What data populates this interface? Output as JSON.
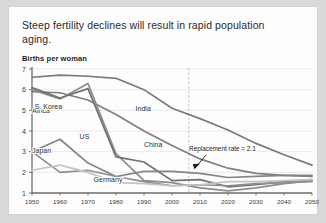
{
  "card": {
    "title": "Steep fertility declines will result in rapid population aging.",
    "y_axis_title": "Births per woman"
  },
  "colors": {
    "background": "#fdfdfd",
    "outer": "#d9d9d9",
    "border": "#d2d2d2",
    "axis": "#6f6f6f",
    "grid": "#e4e4e4",
    "dark_line": "#6e6e6e",
    "mid_line": "#8a8a8a",
    "light_line": "#c2c2c2",
    "text": "#2b2b2b",
    "annotation": "#1c1c1c"
  },
  "chart_data": {
    "type": "line",
    "title": "Steep fertility declines will result in rapid population aging.",
    "ylabel": "Births per woman",
    "xlabel": "",
    "ylim": [
      1,
      7
    ],
    "xlim": [
      1950,
      2050
    ],
    "grid": true,
    "legend_position": "inline-labels",
    "y_ticks": [
      1,
      2,
      3,
      4,
      5,
      6,
      7
    ],
    "x_ticks": [
      1950,
      1960,
      1970,
      1980,
      1990,
      2000,
      2010,
      2020,
      2030,
      2040,
      2050
    ],
    "x": [
      1950,
      1960,
      1970,
      1980,
      1990,
      2000,
      2010,
      2020,
      2030,
      2040,
      2050
    ],
    "series": [
      {
        "name": "Africa",
        "label": "Africa",
        "color": "#7a7a7a",
        "label_x": 1950,
        "label_y": 4.85,
        "values": [
          6.6,
          6.7,
          6.65,
          6.55,
          6.0,
          5.1,
          4.6,
          4.05,
          3.4,
          2.85,
          2.35
        ]
      },
      {
        "name": "India",
        "label": "India",
        "color": "#7f7f7f",
        "label_x": 1987,
        "label_y": 4.95,
        "values": [
          5.9,
          5.85,
          5.5,
          4.8,
          4.0,
          3.3,
          2.65,
          2.2,
          1.95,
          1.85,
          1.8
        ]
      },
      {
        "name": "S. Korea",
        "label": "S. Korea",
        "color": "#8d8d8d",
        "label_x": 1951,
        "label_y": 5.05,
        "values": [
          6.0,
          5.55,
          6.3,
          2.9,
          1.6,
          1.5,
          1.25,
          1.1,
          1.25,
          1.45,
          1.6
        ]
      },
      {
        "name": "China",
        "label": "China",
        "color": "#707070",
        "label_x": 1990,
        "label_y": 3.25,
        "values": [
          6.1,
          5.6,
          6.05,
          2.75,
          2.5,
          1.6,
          1.65,
          1.3,
          1.4,
          1.55,
          1.65
        ]
      },
      {
        "name": "US",
        "label": "US",
        "color": "#858585",
        "label_x": 1967,
        "label_y": 3.6,
        "values": [
          3.0,
          3.6,
          2.45,
          1.8,
          2.05,
          2.05,
          1.95,
          1.75,
          1.8,
          1.85,
          1.85
        ]
      },
      {
        "name": "Japan",
        "label": "Japan",
        "color": "#8f8f8f",
        "label_x": 1950,
        "label_y": 2.95,
        "values": [
          3.0,
          2.0,
          2.1,
          1.8,
          1.55,
          1.35,
          1.4,
          1.35,
          1.45,
          1.5,
          1.55
        ]
      },
      {
        "name": "Germany",
        "label": "Germany",
        "color": "#c4c4c4",
        "label_x": 1972,
        "label_y": 1.55,
        "values": [
          2.1,
          2.35,
          2.0,
          1.5,
          1.45,
          1.35,
          1.4,
          1.55,
          1.55,
          1.6,
          1.65
        ]
      }
    ],
    "annotations": [
      {
        "name": "replacement-rate",
        "text": "Replacement rate = 2.1",
        "value": 2.1,
        "text_x": 2018,
        "text_y": 3.05,
        "arrow_to_x": 2008,
        "arrow_to_y": 2.15
      }
    ],
    "vertical_marker": {
      "name": "projection-start",
      "x": 2006,
      "style": "dashed"
    }
  }
}
